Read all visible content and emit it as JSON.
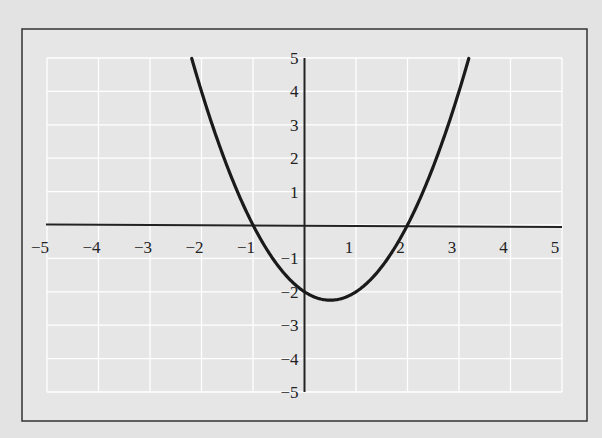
{
  "chart_data": {
    "type": "line",
    "title": "",
    "xlabel": "",
    "ylabel": "",
    "xlim": [
      -5,
      5
    ],
    "ylim": [
      -5,
      5
    ],
    "grid": true,
    "x_ticks": [
      -5,
      -4,
      -3,
      -2,
      -1,
      1,
      2,
      3,
      4,
      5
    ],
    "y_ticks": [
      5,
      4,
      3,
      2,
      1,
      -1,
      -2,
      -3,
      -4,
      -5
    ],
    "x_tick_labels": [
      "−5",
      "−4",
      "−3",
      "−2",
      "−1",
      "1",
      "2",
      "3",
      "4",
      "5"
    ],
    "y_tick_labels": [
      "5",
      "4",
      "3",
      "2",
      "1",
      "−1",
      "−2",
      "−3",
      "−4",
      "−5"
    ],
    "series": [
      {
        "name": "y = x^2 - x - 2",
        "function": "x^2 - x - 2",
        "x_domain": [
          -2.19,
          3.19
        ],
        "key_points": {
          "x_intercepts": [
            -1,
            2
          ],
          "y_intercept": -2,
          "vertex": [
            0.5,
            -2.25
          ],
          "endpoints": [
            [
              -2.19,
              5
            ],
            [
              3.19,
              5
            ]
          ]
        }
      }
    ],
    "legend": null
  },
  "colors": {
    "background": "#e3e3e3",
    "gridline": "#ffffff",
    "axis": "#222222",
    "curve": "#1a1a1a",
    "frame": "#333333"
  }
}
